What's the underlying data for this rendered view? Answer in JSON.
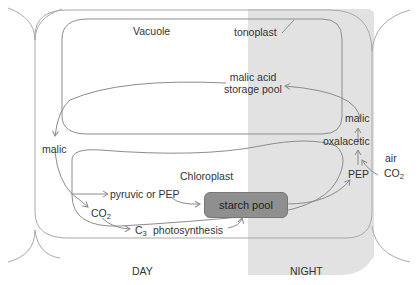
{
  "diagram": {
    "colors": {
      "night_shade": "#e2e2e2",
      "line": "#8c8c8c",
      "starch_fill": "#8f8f8f",
      "text": "#333333"
    },
    "compartments": {
      "vacuole": "Vacuole",
      "tonoplast": "tonoplast",
      "chloroplast": "Chloroplast"
    },
    "nodes": {
      "malic_storage_line1": "malic acid",
      "malic_storage_line2": "storage pool",
      "malic_left": "malic",
      "malic_right": "malic",
      "oxalacetic": "oxalacetic",
      "pep_right": "PEP",
      "air": "air",
      "co2_air": "CO",
      "co2_air_sub": "2",
      "pyruvic": "pyruvic or PEP",
      "co2_day": "CO",
      "co2_day_sub": "2",
      "c3": "C",
      "c3_sub": "3",
      "photosynthesis": "photosynthesis",
      "starch_pool": "starch pool"
    },
    "phases": {
      "day": "DAY",
      "night": "NIGHT"
    }
  }
}
